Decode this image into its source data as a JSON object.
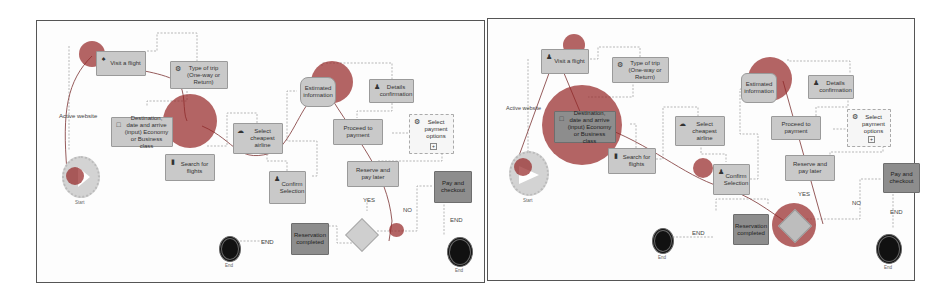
{
  "panels": [
    {
      "id": "left",
      "nodes": {
        "start_label": "Start",
        "visit_flight": "Visit a flight",
        "type_of_trip": "Type of trip (One-way or Return)",
        "destination": "Destination, date and arrive (input) Economy or Business class",
        "search_flights": "Search for flights",
        "select_cheapest": "Select cheapest airline",
        "confirm_selection": "Confirm Selection",
        "calculated_info": "Estimated information",
        "details_confirmation": "Details confirmation",
        "proceed_payment": "Proceed to payment",
        "select_payment": "Select payment options",
        "reserve_pay_later": "Reserve and pay later",
        "pay_checkout": "Pay and checkout",
        "reservation_completed": "Reservation completed",
        "end_label_1": "End",
        "end_label_2": "End"
      },
      "edge_labels": {
        "active_website": "Active website",
        "yes": "YES",
        "no": "NO",
        "end_1": "END",
        "end_2": "END"
      }
    },
    {
      "id": "right",
      "nodes": {
        "start_label": "Start",
        "visit_flight": "Visit a flight",
        "type_of_trip": "Type of trip (One-way or Return)",
        "destination": "Destination, date and arrive (input) Economy or Business class",
        "search_flights": "Search for flights",
        "select_cheapest": "Select cheapest airline",
        "confirm_selection": "Confirm Selection",
        "calculated_info": "Estimated information",
        "details_confirmation": "Details confirmation",
        "proceed_payment": "Proceed to payment",
        "select_payment": "Select payment options",
        "reserve_pay_later": "Reserve and pay later",
        "pay_checkout": "Pay and checkout",
        "reservation_completed": "Reservation completed",
        "end_label_1": "End",
        "end_label_2": "End"
      },
      "edge_labels": {
        "active_website": "Active website",
        "yes": "YES",
        "no": "NO",
        "end_1": "END",
        "end_2": "END"
      }
    }
  ],
  "colors": {
    "task_fill": "#c9c9c9",
    "task_dark_fill": "#8d8d8d",
    "heatmap": "#96282a",
    "end_event": "#111111",
    "border": "#555555"
  }
}
